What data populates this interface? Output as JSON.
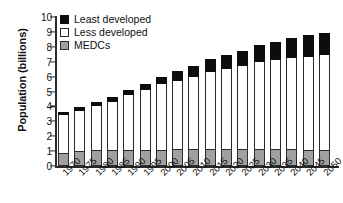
{
  "chart_data": {
    "type": "bar",
    "subtype": "stacked-vertical",
    "title": "",
    "xlabel": "",
    "ylabel": "Population (billions)",
    "ylim": [
      0,
      10
    ],
    "ytick_labels": [
      "10",
      "9",
      "8",
      "7",
      "6",
      "5",
      "4",
      "3",
      "2",
      "1",
      "0"
    ],
    "ytick_values": [
      10,
      9,
      8,
      7,
      6,
      5,
      4,
      3,
      2,
      1,
      0
    ],
    "grid": false,
    "legend_position": "top-left",
    "categories": [
      "1970",
      "1975",
      "1980",
      "1985",
      "1990",
      "1995",
      "2000",
      "2005",
      "2010",
      "2015",
      "2020",
      "2025",
      "2030",
      "2035",
      "2040",
      "2045",
      "2050"
    ],
    "series": [
      {
        "name": "Least developed",
        "color": "#0d0d0d",
        "values": [
          0.15,
          0.23,
          0.27,
          0.31,
          0.38,
          0.44,
          0.52,
          0.62,
          0.73,
          0.85,
          0.97,
          1.05,
          1.15,
          1.25,
          1.33,
          1.42,
          1.5
        ]
      },
      {
        "name": "Less developed",
        "color": "#ffffff",
        "values": [
          2.55,
          2.7,
          3.0,
          3.25,
          3.65,
          4.0,
          4.4,
          4.6,
          4.85,
          5.15,
          5.35,
          5.55,
          5.85,
          5.95,
          6.15,
          6.25,
          6.35
        ]
      },
      {
        "name": "MEDCs",
        "color": "#a0a0a0",
        "values": [
          0.9,
          1.02,
          1.05,
          1.05,
          1.1,
          1.08,
          1.08,
          1.13,
          1.13,
          1.15,
          1.15,
          1.15,
          1.15,
          1.15,
          1.13,
          1.1,
          1.1
        ]
      }
    ],
    "totals": [
      3.6,
      3.95,
      4.32,
      4.61,
      5.13,
      5.52,
      6.0,
      6.35,
      6.71,
      7.15,
      7.47,
      7.75,
      8.15,
      8.35,
      8.61,
      8.77,
      8.95
    ],
    "legend": [
      {
        "label": "Least developed",
        "swatch": "#0d0d0d"
      },
      {
        "label": "Less developed",
        "swatch": "#ffffff"
      },
      {
        "label": "MEDCs",
        "swatch": "#a0a0a0"
      }
    ]
  }
}
